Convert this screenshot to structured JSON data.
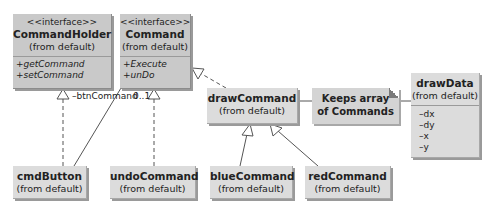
{
  "diagram": {
    "type": "UML class diagram",
    "interfaces": [
      {
        "id": "CommandHolder",
        "stereotype": "<<interface>>",
        "name": "CommandHolder",
        "package": "(from default)",
        "operations": [
          "+getCommand",
          "+setCommand"
        ]
      },
      {
        "id": "Command",
        "stereotype": "<<interface>>",
        "name": "Command",
        "package": "(from default)",
        "operations": [
          "+Execute",
          "+unDo"
        ]
      }
    ],
    "classes": {
      "drawCommand": {
        "name": "drawCommand",
        "package": "(from default)"
      },
      "drawData": {
        "name": "drawData",
        "package": "(from default)",
        "attributes": [
          "–dx",
          "–dy",
          "–x",
          "–y"
        ]
      },
      "cmdButton": {
        "name": "cmdButton",
        "package": "(from default)"
      },
      "undoCommand": {
        "name": "undoCommand",
        "package": "(from default)"
      },
      "blueCommand": {
        "name": "blueCommand",
        "package": "(from default)"
      },
      "redCommand": {
        "name": "redCommand",
        "package": "(from default)"
      }
    },
    "note": {
      "line1": "Keeps array",
      "line2": "of Commands"
    },
    "association": {
      "role": "–btnCommand",
      "multiplicity": "0..1"
    },
    "relationships": [
      {
        "from": "cmdButton",
        "to": "CommandHolder",
        "kind": "realization"
      },
      {
        "from": "cmdButton",
        "to": "Command",
        "kind": "association",
        "role": "–btnCommand",
        "multiplicity": "0..1"
      },
      {
        "from": "undoCommand",
        "to": "Command",
        "kind": "realization"
      },
      {
        "from": "drawCommand",
        "to": "Command",
        "kind": "realization"
      },
      {
        "from": "blueCommand",
        "to": "drawCommand",
        "kind": "generalization"
      },
      {
        "from": "redCommand",
        "to": "drawCommand",
        "kind": "generalization"
      },
      {
        "from": "drawCommand",
        "to": "note",
        "kind": "note-link"
      },
      {
        "from": "note",
        "to": "drawData",
        "kind": "note-link"
      }
    ]
  },
  "colors": {
    "interface_fill": "#c9c9c9",
    "class_fill": "#dcdcdc",
    "line": "#555555"
  }
}
